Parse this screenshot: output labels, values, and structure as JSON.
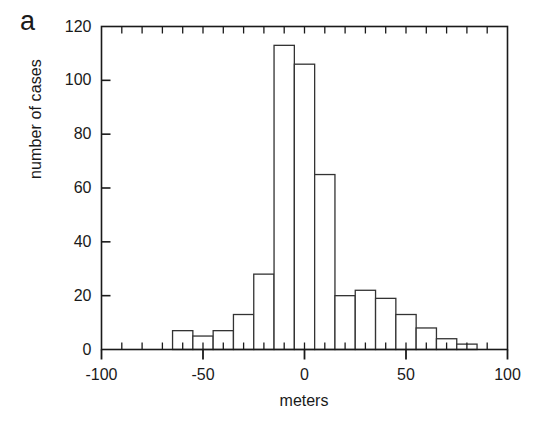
{
  "figure": {
    "panel_label": "a",
    "background_color": "#ffffff",
    "line_color": "#1a1a1a"
  },
  "chart_data": {
    "type": "bar",
    "title": "",
    "subtitle": "",
    "xlabel": "meters",
    "ylabel": "number of cases",
    "xlim": [
      -100,
      100
    ],
    "ylim": [
      0,
      120
    ],
    "grid": false,
    "legend": null,
    "bin_width": 10,
    "bin_starts": [
      -65,
      -55,
      -45,
      -35,
      -25,
      -15,
      -5,
      5,
      15,
      25,
      35,
      45,
      55,
      65,
      75,
      85
    ],
    "categories": [
      "-65 to -55",
      "-55 to -45",
      "-45 to -35",
      "-35 to -25",
      "-25 to -15",
      "-15 to -5",
      "-5 to 5",
      "5 to 15",
      "15 to 25",
      "25 to 35",
      "35 to 45",
      "45 to 55",
      "55 to 65",
      "65 to 75",
      "75 to 85",
      "85 to 95"
    ],
    "values": [
      7,
      5,
      7,
      13,
      28,
      113,
      106,
      65,
      20,
      22,
      19,
      13,
      8,
      4,
      2,
      0
    ],
    "x_major_ticks": [
      -100,
      -50,
      0,
      50,
      100
    ],
    "x_major_tick_labels": [
      "-100",
      "-50",
      "0",
      "50",
      "100"
    ],
    "x_minor_tick_step": 10,
    "y_major_ticks": [
      0,
      20,
      40,
      60,
      80,
      100,
      120
    ],
    "y_major_tick_labels": [
      "0",
      "20",
      "40",
      "60",
      "80",
      "100",
      "120"
    ],
    "bar_fill": "#ffffff",
    "bar_edge": "#333333"
  }
}
